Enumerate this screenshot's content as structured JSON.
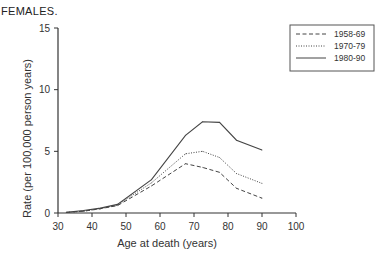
{
  "chart_data": {
    "type": "line",
    "title": "FEMALES.",
    "xlabel": "Age at death (years)",
    "ylabel": "Rate (per 100,000 person years)",
    "xlim": [
      30,
      100
    ],
    "ylim": [
      0,
      15
    ],
    "xticks": [
      30,
      40,
      50,
      60,
      70,
      80,
      90,
      100
    ],
    "yticks": [
      0,
      5,
      10,
      15
    ],
    "grid": false,
    "legend_position": "top-right",
    "x": [
      32.5,
      37.5,
      42.5,
      47.5,
      57.5,
      67.5,
      72.5,
      77.5,
      82.5,
      90
    ],
    "series": [
      {
        "name": "1958-69",
        "style": "dashed",
        "values": [
          0.05,
          0.15,
          0.35,
          0.6,
          2.2,
          4.0,
          3.7,
          3.3,
          2.0,
          1.2
        ]
      },
      {
        "name": "1970-79",
        "style": "dotted",
        "values": [
          0.05,
          0.15,
          0.35,
          0.65,
          2.45,
          4.8,
          5.0,
          4.5,
          3.2,
          2.4
        ]
      },
      {
        "name": "1980-90",
        "style": "solid",
        "values": [
          0.05,
          0.2,
          0.4,
          0.7,
          2.7,
          6.3,
          7.4,
          7.35,
          5.9,
          5.1
        ]
      }
    ]
  }
}
